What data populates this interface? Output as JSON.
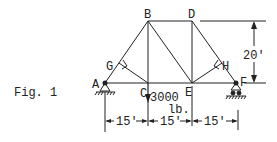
{
  "figure": {
    "caption": "Fig. 1"
  },
  "nodes": {
    "A": "A",
    "B": "B",
    "C": "C",
    "D": "D",
    "E": "E",
    "F": "F",
    "G": "G",
    "H": "H"
  },
  "load": {
    "value": "3000",
    "unit": "lb.",
    "at_node": "C"
  },
  "dimensions": {
    "height": "20'",
    "spans": [
      "15'",
      "15'",
      "15'"
    ]
  },
  "supports": {
    "A": "pin",
    "F": "roller"
  },
  "colors": {
    "ink": "#222222",
    "background": "#ffffff"
  }
}
